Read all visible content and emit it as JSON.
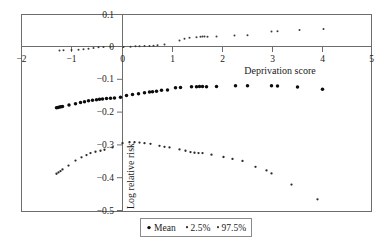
{
  "chart_data": {
    "type": "scatter",
    "title": "",
    "subtitle": "",
    "xlabel": "Deprivation score",
    "ylabel": "Log relative risk",
    "xlim": [
      -2,
      5
    ],
    "ylim": [
      -0.5,
      0.1
    ],
    "xticks": [
      -2,
      -1,
      0,
      1,
      2,
      3,
      4,
      5
    ],
    "xticklabels": [
      "−2",
      "−1",
      "0",
      "1",
      "2",
      "3",
      "4",
      "5"
    ],
    "yticks": [
      0.1,
      0,
      -0.1,
      -0.2,
      -0.3,
      -0.4,
      -0.5
    ],
    "yticklabels": [
      "0.1",
      "0",
      "−0.1",
      "−0.2",
      "−0.3",
      "−0.4",
      "−0.5"
    ],
    "grid": false,
    "zero_line": true,
    "legend_position": "bottom-center",
    "legend": [
      "Mean",
      "2.5%",
      "97.5%"
    ],
    "series": [
      {
        "name": "Mean",
        "marker": "dot",
        "color": "#0c0c0c",
        "points": [
          [
            -1.3,
            -0.184
          ],
          [
            -1.27,
            -0.183
          ],
          [
            -1.24,
            -0.182
          ],
          [
            -1.21,
            -0.181
          ],
          [
            -1.18,
            -0.18
          ],
          [
            -1.05,
            -0.176
          ],
          [
            -0.92,
            -0.172
          ],
          [
            -0.82,
            -0.168
          ],
          [
            -0.74,
            -0.166
          ],
          [
            -0.66,
            -0.163
          ],
          [
            -0.58,
            -0.161
          ],
          [
            -0.5,
            -0.16
          ],
          [
            -0.44,
            -0.158
          ],
          [
            -0.38,
            -0.157
          ],
          [
            -0.3,
            -0.156
          ],
          [
            -0.22,
            -0.155
          ],
          [
            -0.14,
            -0.154
          ],
          [
            -0.02,
            -0.152
          ],
          [
            0.1,
            -0.147
          ],
          [
            0.22,
            -0.144
          ],
          [
            0.34,
            -0.141
          ],
          [
            0.46,
            -0.138
          ],
          [
            0.56,
            -0.136
          ],
          [
            0.62,
            -0.135
          ],
          [
            0.7,
            -0.134
          ],
          [
            0.8,
            -0.131
          ],
          [
            0.92,
            -0.13
          ],
          [
            1.08,
            -0.123
          ],
          [
            1.18,
            -0.122
          ],
          [
            1.4,
            -0.12
          ],
          [
            1.5,
            -0.12
          ],
          [
            1.56,
            -0.119
          ],
          [
            1.62,
            -0.119
          ],
          [
            1.7,
            -0.12
          ],
          [
            1.9,
            -0.119
          ],
          [
            2.28,
            -0.117
          ],
          [
            2.52,
            -0.117
          ],
          [
            3.0,
            -0.117
          ],
          [
            3.12,
            -0.118
          ],
          [
            3.52,
            -0.121
          ],
          [
            4.02,
            -0.128
          ]
        ]
      },
      {
        "name": "2.5%",
        "marker": "dot",
        "color": "#2b2b2b",
        "points": [
          [
            -1.3,
            -0.385
          ],
          [
            -1.26,
            -0.381
          ],
          [
            -1.22,
            -0.377
          ],
          [
            -1.18,
            -0.372
          ],
          [
            -1.06,
            -0.36
          ],
          [
            -0.92,
            -0.345
          ],
          [
            -0.8,
            -0.335
          ],
          [
            -0.7,
            -0.328
          ],
          [
            -0.62,
            -0.322
          ],
          [
            -0.52,
            -0.318
          ],
          [
            -0.42,
            -0.315
          ],
          [
            -0.34,
            -0.312
          ],
          [
            -0.18,
            -0.305
          ],
          [
            0.02,
            -0.292
          ],
          [
            0.16,
            -0.289
          ],
          [
            0.26,
            -0.289
          ],
          [
            0.36,
            -0.29
          ],
          [
            0.46,
            -0.292
          ],
          [
            0.58,
            -0.294
          ],
          [
            0.76,
            -0.3
          ],
          [
            0.86,
            -0.303
          ],
          [
            0.96,
            -0.305
          ],
          [
            1.16,
            -0.311
          ],
          [
            1.28,
            -0.315
          ],
          [
            1.38,
            -0.319
          ],
          [
            1.46,
            -0.321
          ],
          [
            1.54,
            -0.322
          ],
          [
            1.62,
            -0.322
          ],
          [
            1.8,
            -0.327
          ],
          [
            2.04,
            -0.334
          ],
          [
            2.22,
            -0.34
          ],
          [
            2.42,
            -0.346
          ],
          [
            2.68,
            -0.364
          ],
          [
            2.9,
            -0.375
          ],
          [
            3.0,
            -0.384
          ],
          [
            3.4,
            -0.418
          ],
          [
            3.92,
            -0.463
          ]
        ]
      },
      {
        "name": "97.5%",
        "marker": "dot",
        "color": "#3a3a3a",
        "points": [
          [
            -1.24,
            -0.01
          ],
          [
            -1.16,
            -0.009
          ],
          [
            -1.0,
            -0.008
          ],
          [
            -0.86,
            -0.007
          ],
          [
            -0.76,
            -0.006
          ],
          [
            -0.66,
            -0.004
          ],
          [
            -0.56,
            -0.002
          ],
          [
            -0.46,
            0.0
          ],
          [
            -0.36,
            0.001
          ],
          [
            -0.22,
            0.002
          ],
          [
            0.04,
            0.001
          ],
          [
            0.18,
            0.002
          ],
          [
            0.28,
            0.003
          ],
          [
            0.36,
            0.003
          ],
          [
            0.46,
            0.004
          ],
          [
            0.56,
            0.004
          ],
          [
            0.64,
            0.005
          ],
          [
            0.72,
            0.006
          ],
          [
            0.86,
            0.009
          ],
          [
            1.16,
            0.021
          ],
          [
            1.26,
            0.026
          ],
          [
            1.36,
            0.029
          ],
          [
            1.5,
            0.031
          ],
          [
            1.58,
            0.032
          ],
          [
            1.62,
            0.033
          ],
          [
            1.66,
            0.033
          ],
          [
            1.72,
            0.032
          ],
          [
            1.9,
            0.033
          ],
          [
            2.26,
            0.036
          ],
          [
            2.52,
            0.037
          ],
          [
            3.0,
            0.048
          ],
          [
            3.12,
            0.049
          ],
          [
            3.56,
            0.053
          ],
          [
            4.04,
            0.056
          ]
        ]
      }
    ]
  },
  "axes": {
    "x_title": "Deprivation score",
    "y_title": "Log relative risk"
  },
  "legend": {
    "items": [
      {
        "label": "Mean",
        "marker": "dot-large"
      },
      {
        "label": "2.5%",
        "marker": "dot-small"
      },
      {
        "label": "97.5%",
        "marker": "dot-small"
      }
    ]
  },
  "colors": {
    "frame": "#6d6d6d",
    "text": "#1a1a1a",
    "mean": "#0c0c0c",
    "lower": "#2b2b2b",
    "upper": "#3a3a3a",
    "background": "#ffffff"
  }
}
